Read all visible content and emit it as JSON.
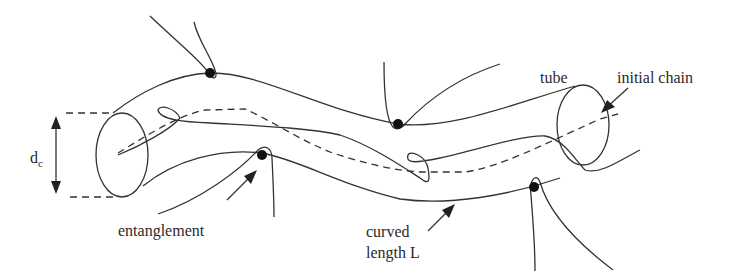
{
  "figure": {
    "labels": {
      "tube": "tube",
      "initial_chain": "initial chain",
      "entanglement": "entanglement",
      "curved_line1": "curved",
      "curved_line2": "length L",
      "diameter_main": "d",
      "diameter_sub": "c"
    },
    "elements": {
      "entanglement_points": 4,
      "tube_ends": 2
    },
    "colors": {
      "stroke": "#333333",
      "dot": "#111111",
      "background": "#ffffff"
    }
  }
}
